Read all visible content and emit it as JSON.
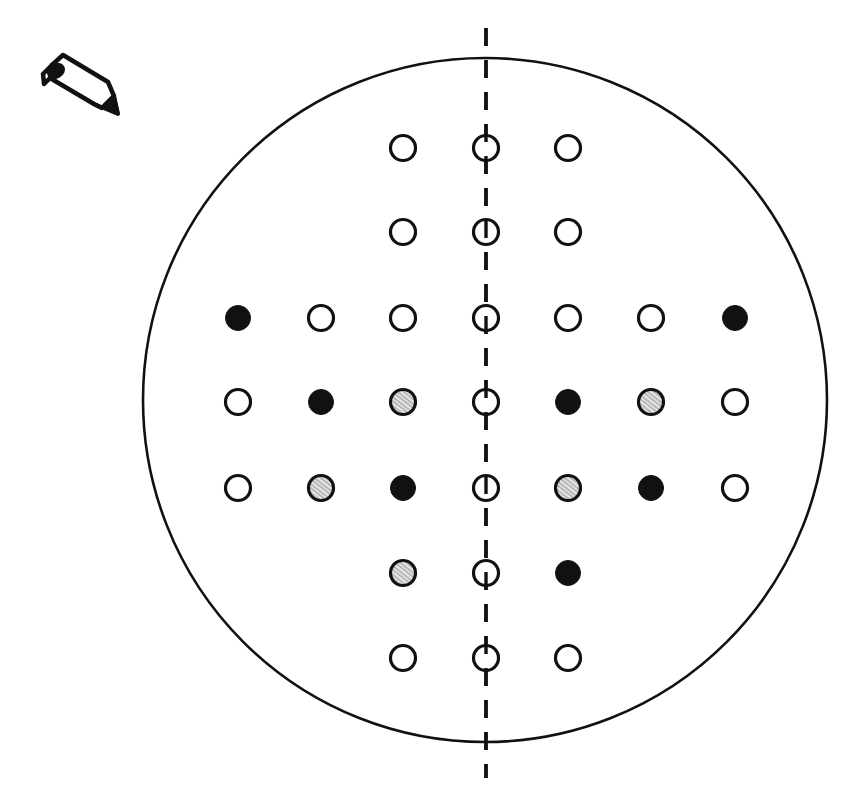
{
  "figure": {
    "title_clipped": "",
    "background_color": "#ffffff",
    "stroke_color": "#111111",
    "boundary": {
      "name": "wafer-outline",
      "shape": "circle",
      "cx": 485,
      "cy": 400,
      "r": 342,
      "stroke_width": 2.6
    },
    "centerline": {
      "name": "vertical-dashed-centerline",
      "x": 486,
      "y1": 28,
      "y2": 778,
      "dash": "18 14",
      "stroke_width": 3.4
    },
    "pencil_icon": {
      "name": "pencil-icon",
      "x": 30,
      "y": 52,
      "width": 92,
      "height": 66,
      "label": "pencil-icon"
    },
    "legend": {
      "open": "open-circle",
      "filled": "filled-circle",
      "hatched": "hatched-circle"
    },
    "grid": {
      "columns_x": [
        238,
        321,
        403,
        486,
        568,
        651,
        735
      ],
      "rows_y": [
        148,
        232,
        318,
        402,
        488,
        573,
        658
      ],
      "marker_radius": 12.5,
      "marker_stroke_width": 3.2,
      "fill_colors": {
        "open": "#ffffff",
        "filled": "#111111",
        "hatched": "#c9c9c9"
      }
    },
    "markers": [
      {
        "row": 0,
        "col": 2,
        "state": "open"
      },
      {
        "row": 0,
        "col": 3,
        "state": "open"
      },
      {
        "row": 0,
        "col": 4,
        "state": "open"
      },
      {
        "row": 1,
        "col": 2,
        "state": "open"
      },
      {
        "row": 1,
        "col": 3,
        "state": "open"
      },
      {
        "row": 1,
        "col": 4,
        "state": "open"
      },
      {
        "row": 2,
        "col": 0,
        "state": "filled"
      },
      {
        "row": 2,
        "col": 1,
        "state": "open"
      },
      {
        "row": 2,
        "col": 2,
        "state": "open"
      },
      {
        "row": 2,
        "col": 3,
        "state": "open"
      },
      {
        "row": 2,
        "col": 4,
        "state": "open"
      },
      {
        "row": 2,
        "col": 5,
        "state": "open"
      },
      {
        "row": 2,
        "col": 6,
        "state": "filled"
      },
      {
        "row": 3,
        "col": 0,
        "state": "open"
      },
      {
        "row": 3,
        "col": 1,
        "state": "filled"
      },
      {
        "row": 3,
        "col": 2,
        "state": "hatched"
      },
      {
        "row": 3,
        "col": 3,
        "state": "open"
      },
      {
        "row": 3,
        "col": 4,
        "state": "filled"
      },
      {
        "row": 3,
        "col": 5,
        "state": "hatched"
      },
      {
        "row": 3,
        "col": 6,
        "state": "open"
      },
      {
        "row": 4,
        "col": 0,
        "state": "open"
      },
      {
        "row": 4,
        "col": 1,
        "state": "hatched"
      },
      {
        "row": 4,
        "col": 2,
        "state": "filled"
      },
      {
        "row": 4,
        "col": 3,
        "state": "open"
      },
      {
        "row": 4,
        "col": 4,
        "state": "hatched"
      },
      {
        "row": 4,
        "col": 5,
        "state": "filled"
      },
      {
        "row": 4,
        "col": 6,
        "state": "open"
      },
      {
        "row": 5,
        "col": 2,
        "state": "hatched"
      },
      {
        "row": 5,
        "col": 3,
        "state": "open"
      },
      {
        "row": 5,
        "col": 4,
        "state": "filled"
      },
      {
        "row": 6,
        "col": 2,
        "state": "open"
      },
      {
        "row": 6,
        "col": 3,
        "state": "open"
      },
      {
        "row": 6,
        "col": 4,
        "state": "open"
      }
    ]
  }
}
